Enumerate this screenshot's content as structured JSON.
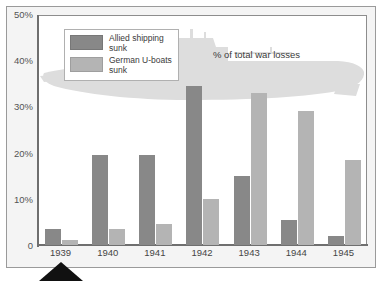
{
  "chart_data": {
    "type": "bar",
    "title": "% of total war losses",
    "xlabel": "",
    "ylabel": "",
    "categories": [
      "1939",
      "1940",
      "1941",
      "1942",
      "1943",
      "1944",
      "1945"
    ],
    "series": [
      {
        "name": "Allied shipping sunk",
        "color": "#888888",
        "values": [
          3.5,
          19.5,
          19.5,
          34.5,
          15.0,
          5.5,
          2.0
        ]
      },
      {
        "name": "German U-boats sunk",
        "color": "#b4b4b4",
        "values": [
          1.0,
          3.5,
          4.5,
          10.0,
          33.0,
          29.0,
          18.5
        ]
      }
    ],
    "ylim": [
      0,
      50
    ],
    "yticks": [
      0,
      10,
      20,
      30,
      40,
      50
    ],
    "ytick_labels": [
      "0",
      "10%",
      "20%",
      "30%",
      "40%",
      "50%"
    ],
    "grid": false,
    "legend_position": "top-left"
  },
  "legend": {
    "items": [
      {
        "label": "Allied shipping sunk",
        "color": "#888888"
      },
      {
        "label": "German U-boats sunk",
        "color": "#b4b4b4"
      }
    ]
  },
  "annotations": {
    "pointer_target": "1939",
    "watermark": "u-boat-silhouette"
  },
  "colors": {
    "dark_bar": "#888888",
    "light_bar": "#b4b4b4",
    "watermark": "#dcdcdc",
    "frame": "#8d8d8d",
    "page_background": "#f4f4f4",
    "plot_background": "#ffffff",
    "pointer": "#111111"
  }
}
